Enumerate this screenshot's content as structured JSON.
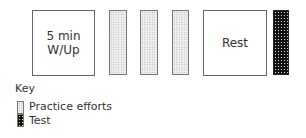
{
  "diagram": {
    "blocks": [
      {
        "type": "warmup",
        "label_line1": "5 min",
        "label_line2": "W/Up"
      },
      {
        "type": "practice"
      },
      {
        "type": "practice"
      },
      {
        "type": "practice"
      },
      {
        "type": "rest",
        "label": "Rest"
      },
      {
        "type": "test"
      }
    ]
  },
  "legend": {
    "title": "Key",
    "items": [
      {
        "label": "Practice efforts",
        "pattern": "light-dotted"
      },
      {
        "label": "Test",
        "pattern": "dark-dotted"
      }
    ]
  },
  "colors": {
    "border": "#666666",
    "practice_fill": "#f2f2f2",
    "test_fill": "#111111"
  }
}
